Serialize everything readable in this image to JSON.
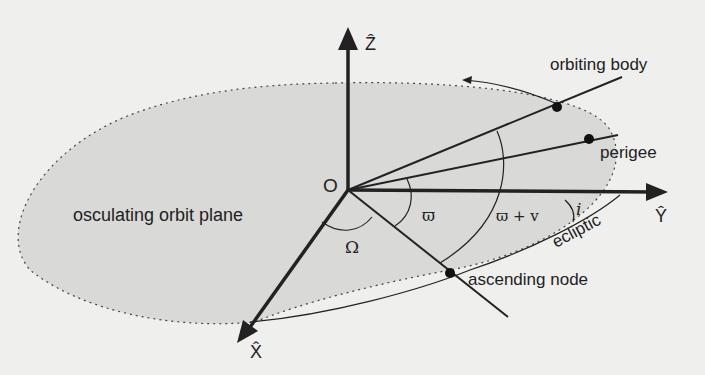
{
  "diagram": {
    "labels": {
      "orbiting_body": "orbiting body",
      "perigee": "perigee",
      "origin": "O",
      "plane": "osculating orbit plane",
      "ascending_node": "ascending node",
      "ecliptic": "ecliptic",
      "omega_big": "Ω",
      "varpi": "ϖ",
      "varpi_plus_v": "ϖ + v",
      "inclination": "i",
      "axis_z": "Ẑ",
      "axis_y": "Ŷ",
      "axis_x": "X̂"
    },
    "colors": {
      "background": "#efefee",
      "plane_fill": "#d9d9d8",
      "lines": "#222222"
    }
  }
}
